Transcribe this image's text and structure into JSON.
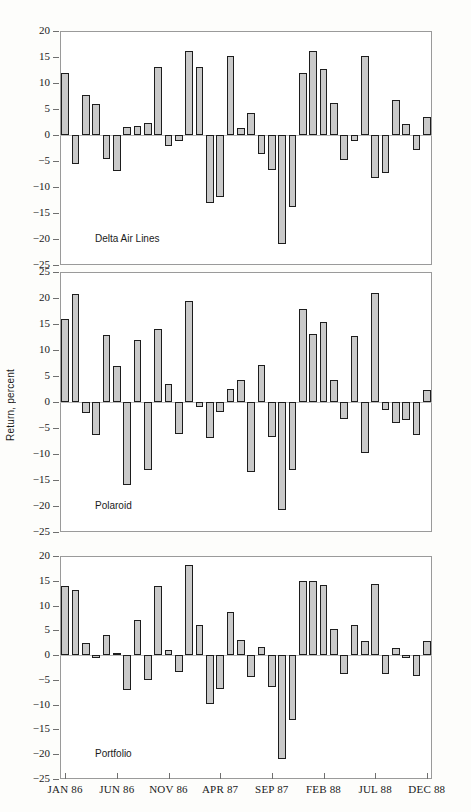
{
  "figure": {
    "ylabel": "Return, percent"
  },
  "axis": {
    "xtick_labels": [
      "JAN 86",
      "JUN 86",
      "NOV 86",
      "APR 87",
      "SEP 87",
      "FEB 88",
      "JUL 88",
      "DEC 88"
    ],
    "xtick_indices": [
      0,
      5,
      10,
      15,
      20,
      25,
      30,
      35
    ],
    "yticks_p1": [
      20,
      15,
      10,
      5,
      0,
      -5,
      -10,
      -15,
      -20,
      -25
    ],
    "yticks_p2": [
      25,
      20,
      15,
      10,
      5,
      0,
      -5,
      -10,
      -15,
      -20,
      -25
    ],
    "yticks_p3": [
      20,
      15,
      10,
      5,
      0,
      -5,
      -10,
      -15,
      -20,
      -25
    ],
    "ytick_labels_p1": [
      "20",
      "15",
      "10",
      "5",
      "0",
      "−5",
      "−10",
      "−15",
      "−20",
      "−25"
    ],
    "ytick_labels_p2": [
      "25",
      "20",
      "15",
      "10",
      "5",
      "0",
      "−5",
      "−10",
      "−15",
      "−20",
      "−25"
    ],
    "ytick_labels_p3": [
      "20",
      "15",
      "10",
      "5",
      "0",
      "−5",
      "−10",
      "−15",
      "−20",
      "−25"
    ]
  },
  "colors": {
    "bar_fill": "#c9c9c9",
    "bar_stroke": "#1d1d1d",
    "frame": "#9a9a9a",
    "zero": "#b9b9b9",
    "page_bg": "#fdfdfb"
  },
  "panels": [
    {
      "name": "Delta Air Lines",
      "ymin": -25,
      "ymax": 20
    },
    {
      "name": "Polaroid",
      "ymin": -25,
      "ymax": 25
    },
    {
      "name": "Portfolio",
      "ymin": -25,
      "ymax": 20
    }
  ],
  "chart_data": {
    "type": "bar",
    "title": "",
    "xlabel": "",
    "ylabel": "Return, percent",
    "grid": false,
    "legend": "none",
    "x": [
      "JAN 86",
      "FEB 86",
      "MAR 86",
      "APR 86",
      "MAY 86",
      "JUN 86",
      "JUL 86",
      "AUG 86",
      "SEP 86",
      "OCT 86",
      "NOV 86",
      "DEC 86",
      "JAN 87",
      "FEB 87",
      "MAR 87",
      "APR 87",
      "MAY 87",
      "JUN 87",
      "JUL 87",
      "AUG 87",
      "SEP 87",
      "OCT 87",
      "NOV 87",
      "DEC 87",
      "JAN 88",
      "FEB 88",
      "MAR 88",
      "APR 88",
      "MAY 88",
      "JUN 88",
      "JUL 88",
      "AUG 88",
      "SEP 88",
      "OCT 88",
      "NOV 88",
      "DEC 88"
    ],
    "xtick_labels": [
      "JAN 86",
      "JUN 86",
      "NOV 86",
      "APR 87",
      "SEP 87",
      "FEB 88",
      "JUL 88",
      "DEC 88"
    ],
    "panels": [
      {
        "name": "Delta Air Lines",
        "ylim": [
          -25,
          20
        ],
        "ytick_step": 5,
        "values": [
          12.0,
          -5.6,
          7.7,
          5.9,
          -4.6,
          -7.0,
          1.6,
          1.7,
          2.4,
          13.0,
          -2.1,
          -1.2,
          16.1,
          13.1,
          -13.0,
          -12.0,
          15.1,
          1.3,
          4.3,
          -3.7,
          -6.8,
          -21.0,
          -13.8,
          12.0,
          16.1,
          12.6,
          6.2,
          -4.8,
          -1.2,
          15.2,
          -8.2,
          -7.3,
          6.8,
          2.2,
          -2.9,
          3.4
        ]
      },
      {
        "name": "Polaroid",
        "ylim": [
          -25,
          25
        ],
        "ytick_step": 5,
        "values": [
          16.0,
          20.8,
          -2.2,
          -6.4,
          12.8,
          7.0,
          -16.0,
          12.0,
          -13.0,
          14.0,
          3.4,
          -6.1,
          19.4,
          -0.9,
          -7.0,
          -2.0,
          2.5,
          4.3,
          -13.4,
          7.2,
          -6.8,
          -20.8,
          -13.0,
          17.8,
          13.1,
          15.4,
          4.3,
          -3.2,
          12.6,
          -9.8,
          21.0,
          -1.5,
          -4.1,
          -3.4,
          -6.4,
          2.4
        ]
      },
      {
        "name": "Portfolio",
        "ylim": [
          -25,
          20
        ],
        "ytick_step": 5,
        "values": [
          14.0,
          13.1,
          2.5,
          -0.6,
          4.1,
          0.4,
          -7.0,
          7.1,
          -5.0,
          14.0,
          1.0,
          -3.4,
          18.2,
          6.0,
          -9.9,
          -6.8,
          8.8,
          3.1,
          -4.4,
          1.7,
          -6.4,
          -21.0,
          -13.0,
          15.0,
          15.0,
          14.1,
          5.2,
          -3.8,
          6.0,
          2.8,
          14.3,
          -3.8,
          1.4,
          -0.5,
          -4.2,
          2.9
        ]
      }
    ]
  }
}
